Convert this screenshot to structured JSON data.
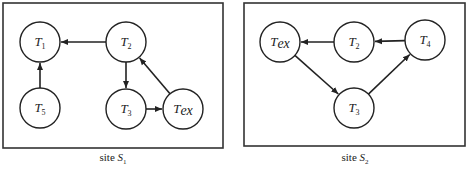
{
  "diagrams": [
    {
      "caption_prefix": "site ",
      "caption_site": "S",
      "caption_sub": "1",
      "nodes": [
        {
          "id": "T1",
          "base": "T",
          "sub": "1",
          "x": 40,
          "y": 42
        },
        {
          "id": "T2",
          "base": "T",
          "sub": "2",
          "x": 126,
          "y": 42
        },
        {
          "id": "T5",
          "base": "T",
          "sub": "5",
          "x": 40,
          "y": 108
        },
        {
          "id": "T3",
          "base": "T",
          "sub": "3",
          "x": 126,
          "y": 109
        },
        {
          "id": "Tex",
          "base": "T",
          "sub": "ex",
          "x": 183,
          "y": 109
        }
      ],
      "edges": [
        {
          "from": "T2",
          "to": "T1"
        },
        {
          "from": "T5",
          "to": "T1"
        },
        {
          "from": "T2",
          "to": "T3"
        },
        {
          "from": "T3",
          "to": "Tex"
        },
        {
          "from": "Tex",
          "to": "T2"
        }
      ]
    },
    {
      "caption_prefix": "site ",
      "caption_site": "S",
      "caption_sub": "2",
      "nodes": [
        {
          "id": "Tex",
          "base": "T",
          "sub": "ex",
          "x": 280,
          "y": 42
        },
        {
          "id": "T2",
          "base": "T",
          "sub": "2",
          "x": 354,
          "y": 42
        },
        {
          "id": "T4",
          "base": "T",
          "sub": "4",
          "x": 425,
          "y": 40
        },
        {
          "id": "T3",
          "base": "T",
          "sub": "3",
          "x": 354,
          "y": 108
        }
      ],
      "edges": [
        {
          "from": "T2",
          "to": "Tex"
        },
        {
          "from": "T4",
          "to": "T2"
        },
        {
          "from": "Tex",
          "to": "T3"
        },
        {
          "from": "T3",
          "to": "T4"
        }
      ]
    }
  ],
  "layout": {
    "node_radius": 20,
    "boxes": [
      {
        "x": 3,
        "y": 3,
        "w": 220,
        "h": 145
      },
      {
        "x": 244,
        "y": 3,
        "w": 221,
        "h": 143
      }
    ]
  },
  "colors": {
    "stroke": "#222222",
    "background": "#ffffff"
  }
}
